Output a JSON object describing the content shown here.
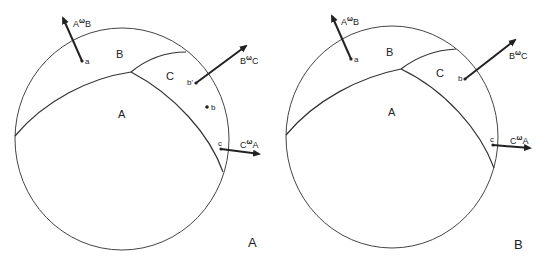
{
  "colors": {
    "line": "#333333",
    "text": "#222222",
    "background": "#ffffff"
  },
  "panels": [
    {
      "id": "A",
      "panel_label": "A",
      "regions": {
        "A": "A",
        "B": "B",
        "C": "C"
      },
      "points": {
        "a": "a",
        "b_prime": "b'",
        "b": "b",
        "c": "c"
      },
      "vectors": {
        "AwB": {
          "base": "A",
          "omega": "ω",
          "sub": "B"
        },
        "BwC": {
          "base": "B",
          "omega": "ω",
          "sub": "C"
        },
        "CwA": {
          "base": "C",
          "omega": "ω",
          "sub": "A"
        }
      }
    },
    {
      "id": "B",
      "panel_label": "B",
      "regions": {
        "A": "A",
        "B": "B",
        "C": "C"
      },
      "points": {
        "a": "a",
        "b": "b",
        "c": "c"
      },
      "vectors": {
        "AwB": {
          "base": "A",
          "omega": "ω",
          "sub": "B"
        },
        "BwC": {
          "base": "B",
          "omega": "ω",
          "sub": "C"
        },
        "CwA": {
          "base": "C",
          "omega": "ω",
          "sub": "A"
        }
      }
    }
  ]
}
